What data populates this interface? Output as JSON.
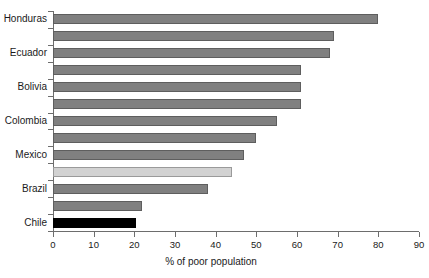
{
  "chart_data": {
    "type": "bar",
    "orientation": "horizontal",
    "title": "",
    "xlabel": "% of poor population",
    "ylabel": "",
    "xlim": [
      0,
      90
    ],
    "xticks": [
      0,
      10,
      20,
      30,
      40,
      50,
      60,
      70,
      80,
      90
    ],
    "grid": false,
    "legend": null,
    "categories": [
      "Honduras",
      "",
      "Ecuador",
      "",
      "Bolivia",
      "",
      "Colombia",
      "",
      "Mexico",
      "",
      "Brazil",
      "",
      "Chile"
    ],
    "visible_tick_labels": [
      "Honduras",
      "Ecuador",
      "Bolivia",
      "Colombia",
      "Mexico",
      "Brazil",
      "Chile"
    ],
    "values": [
      80,
      69,
      68,
      61,
      61,
      61,
      55,
      50,
      47,
      44,
      38,
      22,
      20.5
    ],
    "bar_styles": [
      "normal",
      "normal",
      "normal",
      "normal",
      "normal",
      "normal",
      "normal",
      "normal",
      "normal",
      "light",
      "normal",
      "normal",
      "dark"
    ]
  },
  "colors": {
    "bar_normal": "#808080",
    "bar_normal_edge": "#5e5e5e",
    "bar_light": "#d2d2d2",
    "bar_light_edge": "#9a9a9a",
    "bar_dark": "#000000",
    "axis": "#6d6d6d",
    "text": "#1a1a1a",
    "background": "#ffffff"
  },
  "axis": {
    "x_tick_labels": [
      "0",
      "10",
      "20",
      "30",
      "40",
      "50",
      "60",
      "70",
      "80",
      "90"
    ],
    "x_axis_title": "% of poor population"
  }
}
